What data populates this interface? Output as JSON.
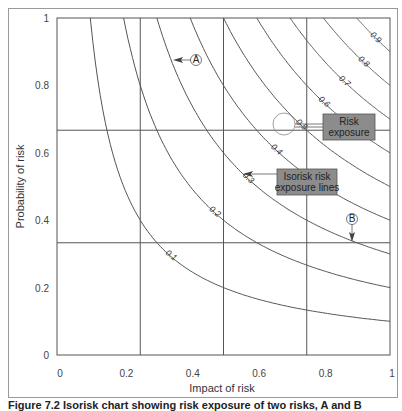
{
  "chart_data": {
    "type": "line",
    "title": "Isorisk chart showing risk exposure of two risks, A and B",
    "xlabel": "Impact of risk",
    "ylabel": "Probability of risk",
    "xlim": [
      0,
      1
    ],
    "ylim": [
      0,
      1
    ],
    "x_ticks": [
      "0",
      "0.2",
      "0.4",
      "0.6",
      "0.8",
      "1"
    ],
    "y_ticks": [
      "0",
      "0.2",
      "0.4",
      "0.6",
      "0.8",
      "1"
    ],
    "grid": {
      "vertical": [
        0.25,
        0.5,
        0.75
      ],
      "horizontal": [
        0.333,
        0.667
      ]
    },
    "series": [
      {
        "name": "0.1",
        "exposure": 0.1
      },
      {
        "name": "0.2",
        "exposure": 0.2
      },
      {
        "name": "0.3",
        "exposure": 0.3
      },
      {
        "name": "0.4",
        "exposure": 0.4
      },
      {
        "name": "0.5",
        "exposure": 0.5
      },
      {
        "name": "0.6",
        "exposure": 0.6
      },
      {
        "name": "0.7",
        "exposure": 0.7
      },
      {
        "name": "0.8",
        "exposure": 0.8
      },
      {
        "name": "0.9",
        "exposure": 0.9
      }
    ],
    "curve_equation": "probability = exposure / impact",
    "annotations": [
      {
        "label": "A",
        "x": 0.37,
        "y": 0.87,
        "type": "circle-marker-arrow-left"
      },
      {
        "label": "B",
        "x": 0.9,
        "y": 0.33,
        "type": "circle-marker-arrow-down"
      },
      {
        "label": "Risk exposure",
        "type": "callout-box",
        "points_to": "0.5 label"
      },
      {
        "label": "Isorisk risk exposure lines",
        "type": "callout-box",
        "points_to": "curves"
      }
    ],
    "legend": null
  },
  "labels": {
    "xlabel": "Impact of risk",
    "ylabel": "Probability of risk",
    "marker_a": "A",
    "marker_b": "B",
    "risk_box_line1": "Risk",
    "risk_box_line2": "exposure",
    "iso_box_line1": "Isorisk risk",
    "iso_box_line2": "exposure lines",
    "caption": "Figure 7.2 Isorisk chart showing risk exposure of two risks, A and B"
  },
  "colors": {
    "line": "#555555",
    "frame": "#9a9a9a",
    "callout_fill": "#8c8c8c",
    "callout_border": "#555555"
  }
}
